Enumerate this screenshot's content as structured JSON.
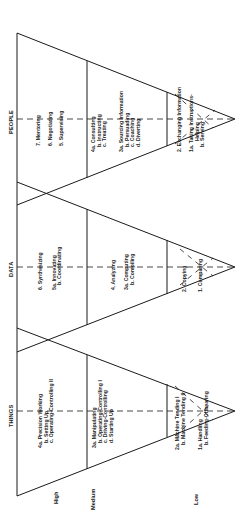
{
  "diagram": {
    "orientation": "rotated -90deg (text reads bottom-to-top)",
    "levels": [
      "High",
      "Medium",
      "Low"
    ],
    "functions": [
      {
        "heading": "PEOPLE",
        "high": [
          "7. Mentoring",
          "6. Negotiating",
          "5. Supervising"
        ],
        "medium_a": [
          "4a. Consulting",
          "b. Instructing",
          "c. Treating"
        ],
        "medium_b": [
          "3a. Sourcing Information",
          "b. Persuading",
          "c. Coaching",
          "d. Diverting"
        ],
        "low_a": [
          "2. Exchanging Information"
        ],
        "low_b": [
          "1a. Taking Instructions-",
          "Helping",
          "b. Serving"
        ]
      },
      {
        "heading": "DATA",
        "high": [
          "6. Synthesizing",
          "5a. Innovating",
          "b. Coordinating"
        ],
        "medium_a": [
          "4. Analyzing"
        ],
        "medium_b": [
          "3a. Computing",
          "b. Compiling"
        ],
        "low_a": [
          "2. Copying"
        ],
        "low_b": [
          "1. Comparing"
        ]
      },
      {
        "heading": "THINGS",
        "high": [
          "4a. Precision Working",
          "b. Setting Up",
          "c. Operating-Controlling II"
        ],
        "medium_a": [
          "3a. Manipulating",
          "b. Operating-Controlling I",
          "c. Driving-Controlling",
          "d. Starting Up"
        ],
        "low_a": [
          "2a. Machine Tending I",
          "b. Machine Tending II"
        ],
        "low_b": [
          "1a. Handling",
          "b. Feeding-Offbearing"
        ]
      }
    ],
    "colors": {
      "line": "#1a1a1a",
      "background": "#ffffff"
    }
  }
}
